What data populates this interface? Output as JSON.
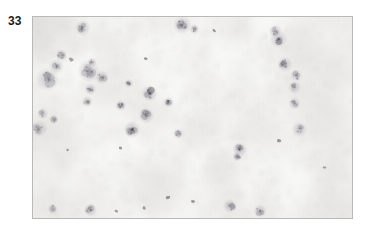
{
  "figure": {
    "label": "33",
    "caption": "",
    "type": "photomicrograph"
  },
  "micrograph": {
    "subject": "peripheral-blood-smear",
    "stain": "wright-giemsa",
    "description": "Peripheral blood smear showing numerous erythrocytes with central pallor and scattered darkly stained nucleated leukocytes / blast cells",
    "frame": {
      "x": 32,
      "y": 16,
      "width": 321,
      "height": 203,
      "border_color": "#b9b9b9"
    },
    "palette": {
      "background": "#fbfbf9",
      "background_mottle": "#f3f2f0",
      "rbc_fill": "#cfcfd2",
      "rbc_rim": "#b9b9bf",
      "rbc_pallor": "#f4f4f3",
      "leukocyte_nucleus": "#4a4550",
      "leukocyte_nucleus_dark": "#2e2a33",
      "leukocyte_cytoplasm": "#8e8a96",
      "platelet": "#6f6b76",
      "vignette": "#e6e5e3"
    },
    "counts": {
      "erythrocytes": 430,
      "leukocytes": 34,
      "platelets": 11
    },
    "rbc_radius_range": [
      3.1,
      5.0
    ],
    "leukocyte_radius_range": [
      3.0,
      8.5
    ],
    "seed": 20233,
    "leukocytes": [
      {
        "x": 0.155,
        "y": 0.055,
        "r": 5.6,
        "tone": 0.78,
        "lobes": 3
      },
      {
        "x": 0.468,
        "y": 0.04,
        "r": 6.4,
        "tone": 0.68,
        "lobes": 3
      },
      {
        "x": 0.76,
        "y": 0.07,
        "r": 4.6,
        "tone": 0.55,
        "lobes": 2
      },
      {
        "x": 0.77,
        "y": 0.11,
        "r": 6.2,
        "tone": 0.8,
        "lobes": 3
      },
      {
        "x": 0.089,
        "y": 0.19,
        "r": 4.4,
        "tone": 0.88,
        "lobes": 1
      },
      {
        "x": 0.073,
        "y": 0.245,
        "r": 5.2,
        "tone": 0.7,
        "lobes": 2
      },
      {
        "x": 0.045,
        "y": 0.31,
        "r": 8.4,
        "tone": 0.66,
        "lobes": 4
      },
      {
        "x": 0.175,
        "y": 0.27,
        "r": 7.8,
        "tone": 0.4,
        "lobes": 4
      },
      {
        "x": 0.215,
        "y": 0.3,
        "r": 5.0,
        "tone": 0.46,
        "lobes": 2
      },
      {
        "x": 0.18,
        "y": 0.36,
        "r": 4.2,
        "tone": 0.5,
        "lobes": 2
      },
      {
        "x": 0.17,
        "y": 0.42,
        "r": 4.0,
        "tone": 0.44,
        "lobes": 2
      },
      {
        "x": 0.79,
        "y": 0.235,
        "r": 5.4,
        "tone": 0.72,
        "lobes": 3
      },
      {
        "x": 0.825,
        "y": 0.29,
        "r": 4.2,
        "tone": 0.68,
        "lobes": 2
      },
      {
        "x": 0.365,
        "y": 0.38,
        "r": 5.8,
        "tone": 0.74,
        "lobes": 3
      },
      {
        "x": 0.82,
        "y": 0.35,
        "r": 4.6,
        "tone": 0.66,
        "lobes": 2
      },
      {
        "x": 0.275,
        "y": 0.44,
        "r": 4.0,
        "tone": 0.82,
        "lobes": 1
      },
      {
        "x": 0.425,
        "y": 0.425,
        "r": 3.8,
        "tone": 0.86,
        "lobes": 1
      },
      {
        "x": 0.82,
        "y": 0.43,
        "r": 4.4,
        "tone": 0.7,
        "lobes": 2
      },
      {
        "x": 0.355,
        "y": 0.49,
        "r": 5.6,
        "tone": 0.72,
        "lobes": 3
      },
      {
        "x": 0.03,
        "y": 0.48,
        "r": 4.0,
        "tone": 0.56,
        "lobes": 2
      },
      {
        "x": 0.02,
        "y": 0.555,
        "r": 6.0,
        "tone": 0.6,
        "lobes": 3
      },
      {
        "x": 0.065,
        "y": 0.51,
        "r": 3.4,
        "tone": 0.84,
        "lobes": 1
      },
      {
        "x": 0.31,
        "y": 0.56,
        "r": 6.2,
        "tone": 0.66,
        "lobes": 3
      },
      {
        "x": 0.835,
        "y": 0.56,
        "r": 5.4,
        "tone": 0.76,
        "lobes": 2
      },
      {
        "x": 0.455,
        "y": 0.58,
        "r": 3.6,
        "tone": 0.58,
        "lobes": 1
      },
      {
        "x": 0.648,
        "y": 0.66,
        "r": 5.2,
        "tone": 0.74,
        "lobes": 3
      },
      {
        "x": 0.64,
        "y": 0.695,
        "r": 3.4,
        "tone": 0.62,
        "lobes": 1
      },
      {
        "x": 0.712,
        "y": 0.965,
        "r": 4.8,
        "tone": 0.74,
        "lobes": 2
      },
      {
        "x": 0.617,
        "y": 0.94,
        "r": 5.0,
        "tone": 0.7,
        "lobes": 2
      },
      {
        "x": 0.18,
        "y": 0.96,
        "r": 4.6,
        "tone": 0.62,
        "lobes": 2
      },
      {
        "x": 0.062,
        "y": 0.955,
        "r": 3.8,
        "tone": 0.86,
        "lobes": 1
      },
      {
        "x": 0.3,
        "y": 0.33,
        "r": 3.2,
        "tone": 0.52,
        "lobes": 1
      },
      {
        "x": 0.185,
        "y": 0.225,
        "r": 3.4,
        "tone": 0.34,
        "lobes": 2
      },
      {
        "x": 0.505,
        "y": 0.06,
        "r": 3.6,
        "tone": 0.44,
        "lobes": 2
      }
    ]
  }
}
